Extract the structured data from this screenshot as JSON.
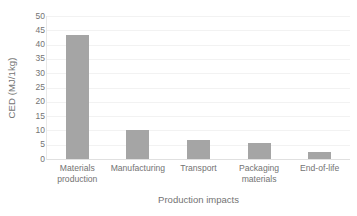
{
  "chart_data": {
    "type": "bar",
    "title": "",
    "xlabel": "Production impacts",
    "ylabel": "CED (MJ/1kg)",
    "categories": [
      "Materials production",
      "Manufacturing",
      "Transport",
      "Packaging materials",
      "End-of-life"
    ],
    "values": [
      43.3,
      10.2,
      6.8,
      5.6,
      2.4
    ],
    "ylim": [
      0,
      50
    ],
    "ytick_step": 5,
    "yticks": [
      50,
      45,
      40,
      35,
      30,
      25,
      20,
      15,
      10,
      5,
      0
    ],
    "ytick_labels": [
      "50",
      "45",
      "40",
      "35",
      "30",
      "25",
      "20",
      "15",
      "10",
      "5",
      "0"
    ],
    "grid": true,
    "grid_axis": "y",
    "legend": false,
    "legend_position": "none",
    "bar_color": "#a5a5a5",
    "gridline_color": "#f2f2f2",
    "text_color": "#737373",
    "background_color": "#ffffff"
  },
  "axes": {
    "y_title": "CED (MJ/1kg)",
    "x_title": "Production impacts"
  },
  "categories": [
    {
      "line1": "Materials",
      "line2": "production"
    },
    {
      "line1": "Manufacturing",
      "line2": ""
    },
    {
      "line1": "Transport",
      "line2": ""
    },
    {
      "line1": "Packaging",
      "line2": "materials"
    },
    {
      "line1": "End-of-life",
      "line2": ""
    }
  ]
}
